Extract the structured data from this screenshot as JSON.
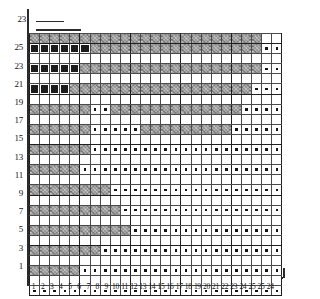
{
  "chart_data": {
    "type": "heatmap",
    "title": "",
    "xlabel": "",
    "ylabel": "",
    "grid_columns": 25,
    "grid_rows": 26,
    "symbols": {
      "empty": "plain white cell",
      "hatch": "hatched / shaded cell",
      "solid": "solid black square",
      "dot": "small centre dot"
    },
    "column_labels": [
      "1",
      "2",
      "3",
      "4",
      "5",
      "6",
      "7",
      "8",
      "9",
      "10",
      "11",
      "12",
      "13",
      "14",
      "15",
      "16",
      "17",
      "18",
      "19",
      "20",
      "21",
      "22",
      "23",
      "24",
      "25"
    ],
    "extra_right_labels": [
      "25",
      "24"
    ],
    "row_labels_odd": [
      "25",
      "23",
      "21",
      "19",
      "17",
      "15",
      "13",
      "11",
      "9",
      "7",
      "5",
      "3",
      "1"
    ],
    "top_marker_label": "23",
    "rows": [
      {
        "label": "26",
        "cells": "hhhhhhhhhhhhhhhhhhhhhhhee"
      },
      {
        "label": "25",
        "cells": "sssssshhhhhhhhhhhhhhhhdsd"
      },
      {
        "label": "24",
        "cells": "eeeeeehhhhhhhhhhhhhhhheed"
      },
      {
        "label": "23",
        "cells": "sssssehhhhhhhhhhhhhhhhedd"
      },
      {
        "label": "22",
        "cells": "eeeeeehhhhhhhhhhhhhhhhedd"
      },
      {
        "label": "21",
        "cells": "ssssehhhhhhhhhhhhhhhhhddd"
      },
      {
        "label": "20",
        "cells": "eeeeeehhhhhhhhhhhhhhhhddd"
      },
      {
        "label": "19",
        "cells": "hhhhhhddhhhhhhhhhhhhhdddd"
      },
      {
        "label": "18",
        "cells": "eeeeeeeeeeeehhhhhhhhhdddd"
      },
      {
        "label": "17",
        "cells": "hhhhhhdddddhhhhhhhhhddddd"
      },
      {
        "label": "16",
        "cells": "eeeeeeeeeeeeeeeeeeeeddddd"
      },
      {
        "label": "15",
        "cells": "hhhhhhddddddddddddddddddd"
      },
      {
        "label": "14",
        "cells": "eeeeeeeeeeeeeeeeeeeeeeeee"
      },
      {
        "label": "13",
        "cells": "hhhhhdddddddddddddddddddd"
      },
      {
        "label": "12",
        "cells": "eeeeeeeeeeeeeeeeeeeeeeeee"
      },
      {
        "label": "11",
        "cells": "hhhhhhhhdddddddddddddddd d"
      },
      {
        "label": "10",
        "cells": "eeeeeeeeeeeeeeeeeeeeeeeee"
      },
      {
        "label": "9",
        "cells": "hhhhhhhhhddddddddddddddddd"
      },
      {
        "label": "8",
        "cells": "eeeeeeeeeeeeeeeeeeeeeeeee"
      },
      {
        "label": "7",
        "cells": "hhhhhhhhhhdddddddddddddd"
      },
      {
        "label": "6",
        "cells": "eeeeeeeeeeeeeeeeeeeeeeeee"
      },
      {
        "label": "5",
        "cells": "hhhhhhhdddddddddddddddddd"
      },
      {
        "label": "4",
        "cells": "eeeeeeeeeeeeeeeeeeeeeeeee"
      },
      {
        "label": "3",
        "cells": "hhhhhddddddddddddddddddddd"
      },
      {
        "label": "2",
        "cells": "eeeeeeeeeeeeeeeeeeeeeeeee"
      },
      {
        "label": "1",
        "cells": "ddddddddddddddddddddddddd"
      }
    ],
    "matrix": [
      [
        "h",
        "h",
        "h",
        "h",
        "h",
        "h",
        "h",
        "h",
        "h",
        "h",
        "h",
        "h",
        "h",
        "h",
        "h",
        "h",
        "h",
        "h",
        "h",
        "h",
        "h",
        "h",
        "h",
        "e",
        "e"
      ],
      [
        "s",
        "s",
        "s",
        "s",
        "s",
        "s",
        "h",
        "h",
        "h",
        "h",
        "h",
        "h",
        "h",
        "h",
        "h",
        "h",
        "h",
        "h",
        "h",
        "h",
        "h",
        "h",
        "h",
        "d",
        "d"
      ],
      [
        "e",
        "e",
        "e",
        "e",
        "e",
        "e",
        "e",
        "e",
        "e",
        "e",
        "e",
        "e",
        "e",
        "e",
        "e",
        "e",
        "e",
        "e",
        "e",
        "e",
        "e",
        "e",
        "e",
        "e",
        "e"
      ],
      [
        "s",
        "s",
        "s",
        "s",
        "s",
        "h",
        "h",
        "h",
        "h",
        "h",
        "h",
        "h",
        "h",
        "h",
        "h",
        "h",
        "h",
        "h",
        "h",
        "h",
        "h",
        "h",
        "h",
        "d",
        "d"
      ],
      [
        "e",
        "e",
        "e",
        "e",
        "e",
        "e",
        "e",
        "e",
        "e",
        "e",
        "e",
        "e",
        "e",
        "e",
        "e",
        "e",
        "e",
        "e",
        "e",
        "e",
        "e",
        "e",
        "e",
        "e",
        "e"
      ],
      [
        "s",
        "s",
        "s",
        "s",
        "h",
        "h",
        "h",
        "h",
        "h",
        "h",
        "h",
        "h",
        "h",
        "h",
        "h",
        "h",
        "h",
        "h",
        "h",
        "h",
        "h",
        "h",
        "d",
        "d",
        "d"
      ],
      [
        "e",
        "e",
        "e",
        "e",
        "e",
        "e",
        "e",
        "e",
        "e",
        "e",
        "e",
        "e",
        "e",
        "e",
        "e",
        "e",
        "e",
        "e",
        "e",
        "e",
        "e",
        "e",
        "e",
        "e",
        "e"
      ],
      [
        "h",
        "h",
        "h",
        "h",
        "h",
        "h",
        "d",
        "d",
        "h",
        "h",
        "h",
        "h",
        "h",
        "h",
        "h",
        "h",
        "h",
        "h",
        "h",
        "h",
        "h",
        "d",
        "d",
        "d",
        "d"
      ],
      [
        "e",
        "e",
        "e",
        "e",
        "e",
        "e",
        "e",
        "e",
        "e",
        "e",
        "e",
        "e",
        "e",
        "e",
        "e",
        "e",
        "e",
        "e",
        "e",
        "e",
        "e",
        "e",
        "e",
        "e",
        "e"
      ],
      [
        "h",
        "h",
        "h",
        "h",
        "h",
        "h",
        "d",
        "d",
        "d",
        "d",
        "d",
        "h",
        "h",
        "h",
        "h",
        "h",
        "h",
        "h",
        "h",
        "h",
        "d",
        "d",
        "d",
        "d",
        "d"
      ],
      [
        "e",
        "e",
        "e",
        "e",
        "e",
        "e",
        "e",
        "e",
        "e",
        "e",
        "e",
        "e",
        "e",
        "e",
        "e",
        "e",
        "e",
        "e",
        "e",
        "e",
        "e",
        "e",
        "e",
        "e",
        "e"
      ],
      [
        "h",
        "h",
        "h",
        "h",
        "h",
        "h",
        "d",
        "d",
        "d",
        "d",
        "d",
        "d",
        "d",
        "d",
        "d",
        "d",
        "d",
        "d",
        "d",
        "d",
        "d",
        "d",
        "d",
        "d",
        "d"
      ],
      [
        "e",
        "e",
        "e",
        "e",
        "e",
        "e",
        "e",
        "e",
        "e",
        "e",
        "e",
        "e",
        "e",
        "e",
        "e",
        "e",
        "e",
        "e",
        "e",
        "e",
        "e",
        "e",
        "e",
        "e",
        "e"
      ],
      [
        "h",
        "h",
        "h",
        "h",
        "h",
        "d",
        "d",
        "d",
        "d",
        "d",
        "d",
        "d",
        "d",
        "d",
        "d",
        "d",
        "d",
        "d",
        "d",
        "d",
        "d",
        "d",
        "d",
        "d",
        "d"
      ],
      [
        "e",
        "e",
        "e",
        "e",
        "e",
        "e",
        "e",
        "e",
        "e",
        "e",
        "e",
        "e",
        "e",
        "e",
        "e",
        "e",
        "e",
        "e",
        "e",
        "e",
        "e",
        "e",
        "e",
        "e",
        "e"
      ],
      [
        "h",
        "h",
        "h",
        "h",
        "h",
        "h",
        "h",
        "h",
        "d",
        "d",
        "d",
        "d",
        "d",
        "d",
        "d",
        "d",
        "d",
        "d",
        "d",
        "d",
        "d",
        "d",
        "d",
        "d",
        "d"
      ],
      [
        "e",
        "e",
        "e",
        "e",
        "e",
        "e",
        "e",
        "e",
        "e",
        "e",
        "e",
        "e",
        "e",
        "e",
        "e",
        "e",
        "e",
        "e",
        "e",
        "e",
        "e",
        "e",
        "e",
        "e",
        "e"
      ],
      [
        "h",
        "h",
        "h",
        "h",
        "h",
        "h",
        "h",
        "h",
        "h",
        "d",
        "d",
        "d",
        "d",
        "d",
        "d",
        "d",
        "d",
        "d",
        "d",
        "d",
        "d",
        "d",
        "d",
        "d",
        "d"
      ],
      [
        "e",
        "e",
        "e",
        "e",
        "e",
        "e",
        "e",
        "e",
        "e",
        "e",
        "e",
        "e",
        "e",
        "e",
        "e",
        "e",
        "e",
        "e",
        "e",
        "e",
        "e",
        "e",
        "e",
        "e",
        "e"
      ],
      [
        "h",
        "h",
        "h",
        "h",
        "h",
        "h",
        "h",
        "h",
        "h",
        "h",
        "d",
        "d",
        "d",
        "d",
        "d",
        "d",
        "d",
        "d",
        "d",
        "d",
        "d",
        "d",
        "d",
        "d",
        "d"
      ],
      [
        "e",
        "e",
        "e",
        "e",
        "e",
        "e",
        "e",
        "e",
        "e",
        "e",
        "e",
        "e",
        "e",
        "e",
        "e",
        "e",
        "e",
        "e",
        "e",
        "e",
        "e",
        "e",
        "e",
        "e",
        "e"
      ],
      [
        "h",
        "h",
        "h",
        "h",
        "h",
        "h",
        "h",
        "d",
        "d",
        "d",
        "d",
        "d",
        "d",
        "d",
        "d",
        "d",
        "d",
        "d",
        "d",
        "d",
        "d",
        "d",
        "d",
        "d",
        "d"
      ],
      [
        "e",
        "e",
        "e",
        "e",
        "e",
        "e",
        "e",
        "e",
        "e",
        "e",
        "e",
        "e",
        "e",
        "e",
        "e",
        "e",
        "e",
        "e",
        "e",
        "e",
        "e",
        "e",
        "e",
        "e",
        "e"
      ],
      [
        "h",
        "h",
        "h",
        "h",
        "h",
        "d",
        "d",
        "d",
        "d",
        "d",
        "d",
        "d",
        "d",
        "d",
        "d",
        "d",
        "d",
        "d",
        "d",
        "d",
        "d",
        "d",
        "d",
        "d",
        "d"
      ],
      [
        "e",
        "e",
        "e",
        "e",
        "e",
        "e",
        "e",
        "e",
        "e",
        "e",
        "e",
        "e",
        "e",
        "e",
        "e",
        "e",
        "e",
        "e",
        "e",
        "e",
        "e",
        "e",
        "e",
        "e",
        "e"
      ],
      [
        "d",
        "d",
        "d",
        "d",
        "d",
        "d",
        "d",
        "d",
        "d",
        "d",
        "d",
        "d",
        "d",
        "d",
        "d",
        "d",
        "d",
        "d",
        "d",
        "d",
        "d",
        "d",
        "d",
        "d",
        "d"
      ]
    ]
  },
  "axis": {
    "top_marker_label": "23",
    "row_labels": [
      {
        "text": "25",
        "row_index": 1
      },
      {
        "text": "23",
        "row_index": 3
      },
      {
        "text": "21",
        "row_index": 5
      },
      {
        "text": "19",
        "row_index": 7
      },
      {
        "text": "17",
        "row_index": 9
      },
      {
        "text": "15",
        "row_index": 11
      },
      {
        "text": "13",
        "row_index": 13
      },
      {
        "text": "11",
        "row_index": 15
      },
      {
        "text": "9",
        "row_index": 17
      },
      {
        "text": "7",
        "row_index": 19
      },
      {
        "text": "5",
        "row_index": 21
      },
      {
        "text": "3",
        "row_index": 23
      },
      {
        "text": "1",
        "row_index": 25
      }
    ],
    "column_labels": [
      "1",
      "2",
      "3",
      "4",
      "5",
      "6",
      "7",
      "8",
      "9",
      "10",
      "11",
      "12",
      "13",
      "14",
      "15",
      "16",
      "17",
      "18",
      "19",
      "20",
      "21",
      "22",
      "23",
      "24",
      "25"
    ],
    "trailing_labels": [
      "25",
      "24"
    ]
  },
  "colors": {
    "ink": "#1b1b1b",
    "grid_line": "#4a4a4a",
    "major_line": "#1f1f1f",
    "hatch_fill": "#cfcfcf",
    "background": "#ffffff"
  }
}
